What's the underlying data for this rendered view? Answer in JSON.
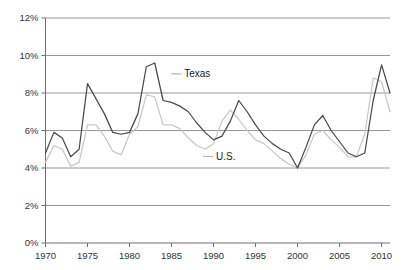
{
  "chart_data": {
    "type": "line",
    "title": "",
    "xlabel": "",
    "ylabel": "",
    "xlim": [
      1970,
      2011
    ],
    "ylim": [
      0,
      12
    ],
    "grid": true,
    "grid_axis": "y",
    "legend_position": "inline-annotations",
    "y_ticks": [
      0,
      2,
      4,
      6,
      8,
      10,
      12
    ],
    "y_tick_labels": [
      "0%",
      "2%",
      "4%",
      "6%",
      "8%",
      "10%",
      "12%"
    ],
    "x_ticks": [
      1970,
      1975,
      1980,
      1985,
      1990,
      1995,
      2000,
      2005,
      2010
    ],
    "x_tick_labels": [
      "1970",
      "1975",
      "1980",
      "1985",
      "1990",
      "1995",
      "2000",
      "2005",
      "2010"
    ],
    "x": [
      1970,
      1971,
      1972,
      1973,
      1974,
      1975,
      1976,
      1977,
      1978,
      1979,
      1980,
      1981,
      1982,
      1983,
      1984,
      1985,
      1986,
      1987,
      1988,
      1989,
      1990,
      1991,
      1992,
      1993,
      1994,
      1995,
      1996,
      1997,
      1998,
      1999,
      2000,
      2001,
      2002,
      2003,
      2004,
      2005,
      2006,
      2007,
      2008,
      2009,
      2010,
      2011
    ],
    "series": [
      {
        "name": "Texas",
        "color": "#4a4a4a",
        "label": "Texas",
        "label_x": 1986.5,
        "label_y": 8.85,
        "values": [
          4.8,
          5.9,
          5.6,
          4.6,
          5.0,
          8.5,
          7.7,
          6.9,
          5.9,
          5.8,
          5.9,
          6.9,
          9.4,
          9.6,
          7.6,
          7.5,
          7.3,
          7.0,
          6.4,
          5.9,
          5.5,
          5.7,
          6.5,
          7.6,
          7.0,
          6.3,
          5.7,
          5.3,
          5.0,
          4.8,
          4.0,
          5.1,
          6.3,
          6.8,
          6.0,
          5.4,
          4.8,
          4.6,
          4.8,
          7.6,
          9.5,
          8.0
        ]
      },
      {
        "name": "U.S.",
        "color": "#c8c8c8",
        "label": "U.S.",
        "label_x": 1990.3,
        "label_y": 4.45,
        "values": [
          4.3,
          5.2,
          5.0,
          4.1,
          4.3,
          6.3,
          6.3,
          5.7,
          4.9,
          4.7,
          5.8,
          6.2,
          7.9,
          7.8,
          6.3,
          6.3,
          6.1,
          5.6,
          5.2,
          5.0,
          5.3,
          6.5,
          7.1,
          6.6,
          6.0,
          5.5,
          5.3,
          4.9,
          4.5,
          4.2,
          4.0,
          4.7,
          5.8,
          6.0,
          5.5,
          5.1,
          4.6,
          4.6,
          5.8,
          8.8,
          8.6,
          7.0
        ]
      }
    ]
  },
  "axes": {
    "y_axis_name": "percent-axis",
    "x_axis_name": "year-axis"
  }
}
